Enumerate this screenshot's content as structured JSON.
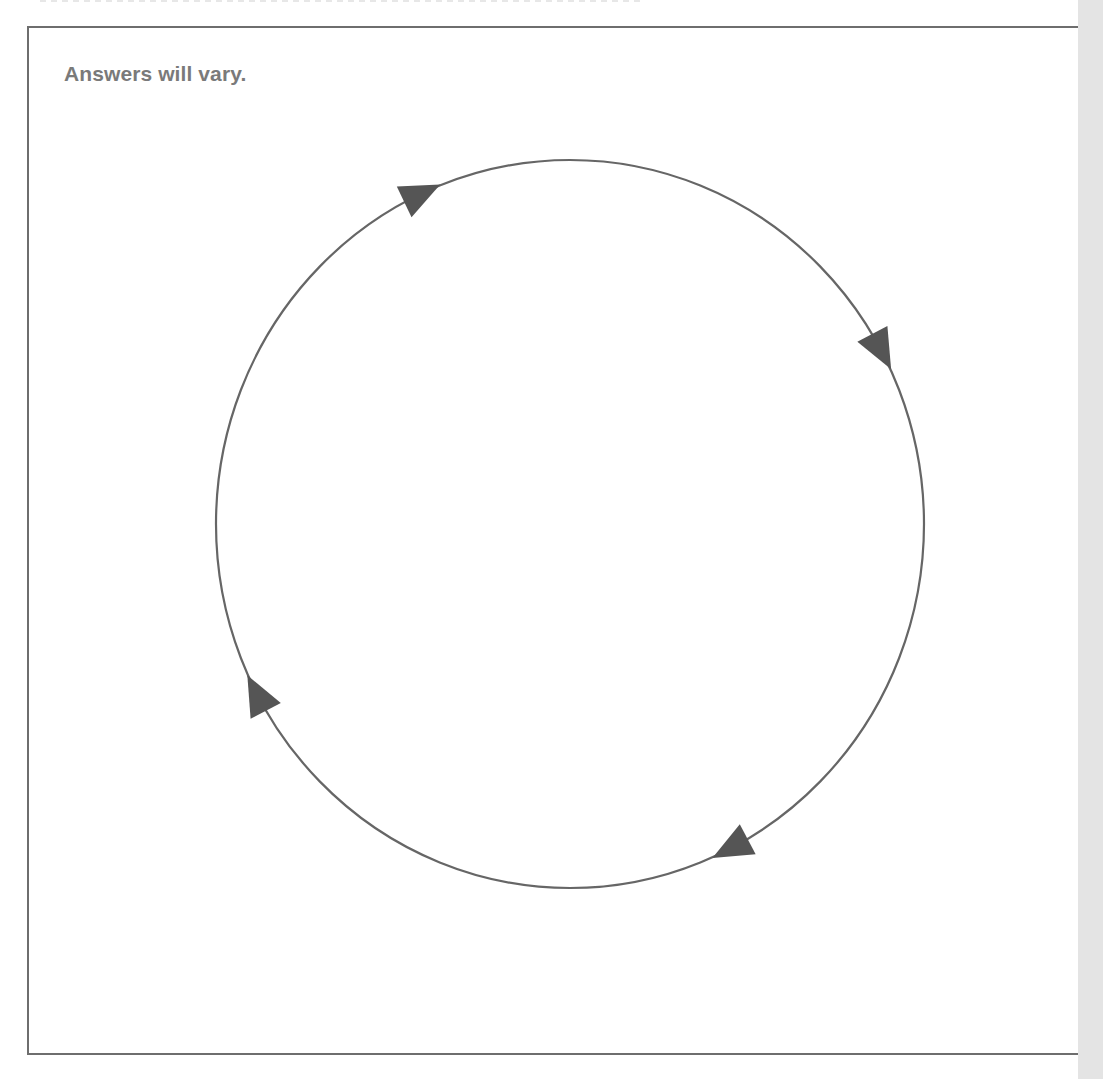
{
  "answer_box": {
    "text": "Answers will vary."
  },
  "diagram": {
    "type": "cycle",
    "shape": "circle",
    "direction": "clockwise",
    "center": [
      570,
      524
    ],
    "radius_x": 354,
    "radius_y": 364,
    "stroke_color": "#666666",
    "arrow_color": "#555555",
    "arrow_angles_deg": [
      -115,
      -28.6,
      62.8,
      152
    ],
    "labels": []
  },
  "colors": {
    "text": "#7a7a7a",
    "border": "#6e6e6e",
    "side_strip": "#e4e4e4",
    "background": "#ffffff"
  }
}
